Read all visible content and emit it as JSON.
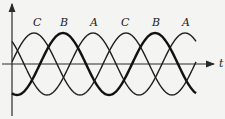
{
  "diagram": {
    "title": "",
    "axis_label_t": "t",
    "peak_labels": [
      "C",
      "B",
      "A",
      "C",
      "B",
      "A"
    ],
    "colors": {
      "curve": "#1e1e1e",
      "axis": "#2a2a2a",
      "background": "#f4f4f2"
    }
  },
  "chart_data": {
    "type": "line",
    "title": "",
    "xlabel": "t",
    "ylabel": "",
    "grid": false,
    "legend": "none",
    "series": [
      {
        "name": "A",
        "phase_deg": 0,
        "amplitude": 1,
        "cycles_shown": 2,
        "weight": "normal"
      },
      {
        "name": "B",
        "phase_deg": -120,
        "amplitude": 1,
        "cycles_shown": 2,
        "weight": "bold"
      },
      {
        "name": "C",
        "phase_deg": 120,
        "amplitude": 1,
        "cycles_shown": 2,
        "weight": "normal"
      }
    ],
    "peak_order": [
      "C",
      "B",
      "A",
      "C",
      "B",
      "A"
    ]
  }
}
